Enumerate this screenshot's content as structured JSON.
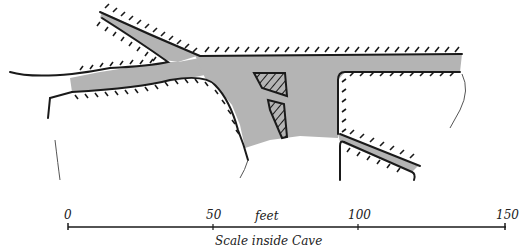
{
  "diagram": {
    "type": "cave plan",
    "colors": {
      "passage_fill": "#b4b4b4",
      "wall_stroke": "#1a1a1a",
      "background": "#ffffff"
    },
    "features": [
      "upper-left branch passage",
      "left entrance passage",
      "main east passage",
      "central chamber with two pillars",
      "lower-right branch passage"
    ]
  },
  "scale": {
    "ticks": [
      "0",
      "50",
      "100",
      "150"
    ],
    "unit_label": "feet",
    "caption": "Scale inside Cave"
  }
}
